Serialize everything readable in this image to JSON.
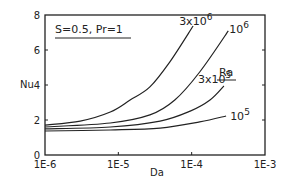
{
  "chart_data": {
    "type": "line",
    "title": "",
    "annotation": "S=0.5, Pr=1",
    "xlabel": "Da",
    "ylabel": "Nu",
    "xscale": "log",
    "xlim": [
      1e-06,
      0.001
    ],
    "ylim": [
      0,
      8
    ],
    "xticks": [
      "1E-6",
      "1E-5",
      "1E-4",
      "1E-3"
    ],
    "yticks": [
      "0",
      "2",
      "4",
      "6",
      "8"
    ],
    "grid": false,
    "legend_title": "Ra",
    "series": [
      {
        "name": "3x10^6",
        "label_base": "3x10",
        "label_exp": "6",
        "log_da": [
          -6.0,
          -5.52,
          -5.11,
          -4.84,
          -4.57,
          -4.3,
          -3.98
        ],
        "nu": [
          1.71,
          1.94,
          2.46,
          3.14,
          3.89,
          5.31,
          7.37
        ]
      },
      {
        "name": "10^6",
        "label_base": "10",
        "label_exp": "6",
        "log_da": [
          -6.0,
          -5.11,
          -4.57,
          -4.23,
          -3.89,
          -3.5
        ],
        "nu": [
          1.6,
          1.83,
          2.29,
          3.14,
          4.74,
          7.09
        ]
      },
      {
        "name": "3x10^5",
        "label_base": "3x10",
        "label_exp": "5",
        "log_da": [
          -6.0,
          -5.11,
          -4.43,
          -4.02,
          -3.75,
          -3.56
        ],
        "nu": [
          1.49,
          1.6,
          1.94,
          2.51,
          3.14,
          3.94
        ]
      },
      {
        "name": "10^5",
        "label_base": "10",
        "label_exp": "5",
        "log_da": [
          -6.0,
          -5.11,
          -4.43,
          -3.89,
          -3.53
        ],
        "nu": [
          1.37,
          1.43,
          1.54,
          1.89,
          2.23
        ]
      }
    ]
  }
}
